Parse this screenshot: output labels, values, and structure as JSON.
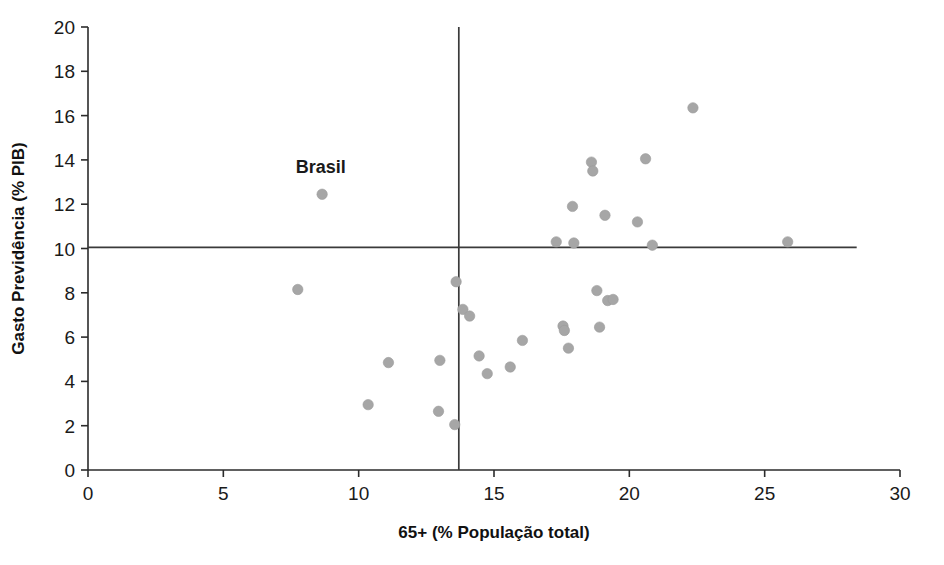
{
  "chart_data": {
    "type": "scatter",
    "title": "",
    "xlabel": "65+ (% População total)",
    "ylabel": "Gasto Previdência (% PIB)",
    "xlim": [
      0,
      30
    ],
    "ylim": [
      0,
      20
    ],
    "xticks": [
      "0",
      "5",
      "10",
      "15",
      "20",
      "25",
      "30"
    ],
    "xtick_values": [
      0,
      5,
      10,
      15,
      20,
      25,
      30
    ],
    "yticks": [
      "0",
      "2",
      "4",
      "6",
      "8",
      "10",
      "12",
      "14",
      "16",
      "18",
      "20"
    ],
    "ytick_values": [
      0,
      2,
      4,
      6,
      8,
      10,
      12,
      14,
      16,
      18,
      20
    ],
    "grid": false,
    "legend": false,
    "marker_color": "#a6a6a6",
    "axis_color": "#2b2b2b",
    "reference_lines": [
      {
        "orientation": "horizontal",
        "value": 10.05,
        "x_from": 0,
        "x_to": 28.4,
        "color": "#3a3a3a"
      },
      {
        "orientation": "vertical",
        "value": 13.7,
        "y_from": 0,
        "y_to": 20,
        "color": "#3a3a3a"
      }
    ],
    "annotations": [
      {
        "text": "Brasil",
        "x": 8.6,
        "y": 13.4,
        "anchor": "middle",
        "bold": true
      }
    ],
    "points": [
      {
        "x": 7.75,
        "y": 8.15,
        "label": ""
      },
      {
        "x": 8.65,
        "y": 12.45,
        "label": "Brasil"
      },
      {
        "x": 10.35,
        "y": 2.95,
        "label": ""
      },
      {
        "x": 11.1,
        "y": 4.85,
        "label": ""
      },
      {
        "x": 13.0,
        "y": 4.95,
        "label": ""
      },
      {
        "x": 12.95,
        "y": 2.65,
        "label": ""
      },
      {
        "x": 13.55,
        "y": 2.05,
        "label": ""
      },
      {
        "x": 13.6,
        "y": 8.5,
        "label": ""
      },
      {
        "x": 13.85,
        "y": 7.25,
        "label": ""
      },
      {
        "x": 14.1,
        "y": 6.95,
        "label": ""
      },
      {
        "x": 14.45,
        "y": 5.15,
        "label": ""
      },
      {
        "x": 14.75,
        "y": 4.35,
        "label": ""
      },
      {
        "x": 15.6,
        "y": 4.65,
        "label": ""
      },
      {
        "x": 16.05,
        "y": 5.85,
        "label": ""
      },
      {
        "x": 17.3,
        "y": 10.3,
        "label": ""
      },
      {
        "x": 17.55,
        "y": 6.5,
        "label": ""
      },
      {
        "x": 17.6,
        "y": 6.3,
        "label": ""
      },
      {
        "x": 17.75,
        "y": 5.5,
        "label": ""
      },
      {
        "x": 17.9,
        "y": 11.9,
        "label": ""
      },
      {
        "x": 17.95,
        "y": 10.25,
        "label": ""
      },
      {
        "x": 18.6,
        "y": 13.9,
        "label": ""
      },
      {
        "x": 18.65,
        "y": 13.5,
        "label": ""
      },
      {
        "x": 18.8,
        "y": 8.1,
        "label": ""
      },
      {
        "x": 18.9,
        "y": 6.45,
        "label": ""
      },
      {
        "x": 19.1,
        "y": 11.5,
        "label": ""
      },
      {
        "x": 19.2,
        "y": 7.65,
        "label": ""
      },
      {
        "x": 19.4,
        "y": 7.7,
        "label": ""
      },
      {
        "x": 20.3,
        "y": 11.2,
        "label": ""
      },
      {
        "x": 20.6,
        "y": 14.05,
        "label": ""
      },
      {
        "x": 20.85,
        "y": 10.15,
        "label": ""
      },
      {
        "x": 22.35,
        "y": 16.35,
        "label": ""
      },
      {
        "x": 25.85,
        "y": 10.3,
        "label": ""
      }
    ]
  }
}
